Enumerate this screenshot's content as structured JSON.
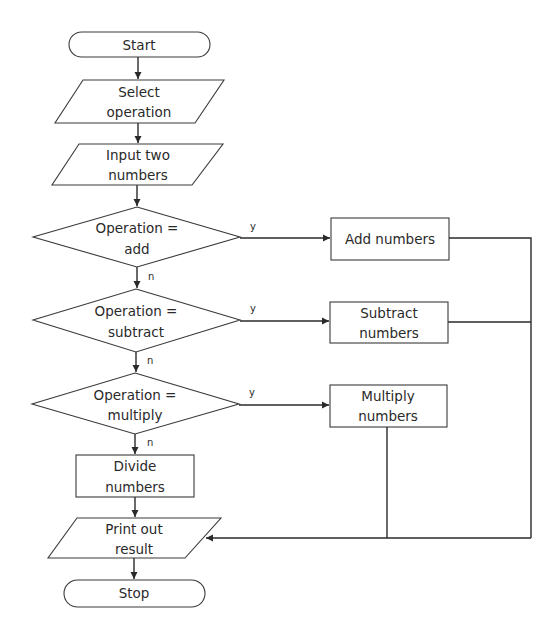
{
  "diagram": {
    "type": "flowchart",
    "nodes": {
      "start": {
        "shape": "terminator",
        "lines": [
          "Start"
        ]
      },
      "select": {
        "shape": "input-output",
        "lines": [
          "Select",
          "operation"
        ]
      },
      "input": {
        "shape": "input-output",
        "lines": [
          "Input two",
          "numbers"
        ]
      },
      "dec_add": {
        "shape": "decision",
        "lines": [
          "Operation =",
          "add"
        ]
      },
      "dec_sub": {
        "shape": "decision",
        "lines": [
          "Operation =",
          "subtract"
        ]
      },
      "dec_mul": {
        "shape": "decision",
        "lines": [
          "Operation =",
          "multiply"
        ]
      },
      "add": {
        "shape": "process",
        "lines": [
          "Add numbers"
        ]
      },
      "sub": {
        "shape": "process",
        "lines": [
          "Subtract",
          "numbers"
        ]
      },
      "mul": {
        "shape": "process",
        "lines": [
          "Multiply",
          "numbers"
        ]
      },
      "div": {
        "shape": "process",
        "lines": [
          "Divide",
          "numbers"
        ]
      },
      "print": {
        "shape": "input-output",
        "lines": [
          "Print out",
          "result"
        ]
      },
      "stop": {
        "shape": "terminator",
        "lines": [
          "Stop"
        ]
      }
    },
    "edge_labels": {
      "yes": "y",
      "no": "n"
    },
    "edges": [
      {
        "from": "start",
        "to": "select"
      },
      {
        "from": "select",
        "to": "input"
      },
      {
        "from": "input",
        "to": "dec_add"
      },
      {
        "from": "dec_add",
        "to": "add",
        "label": "y"
      },
      {
        "from": "dec_add",
        "to": "dec_sub",
        "label": "n"
      },
      {
        "from": "dec_sub",
        "to": "sub",
        "label": "y"
      },
      {
        "from": "dec_sub",
        "to": "dec_mul",
        "label": "n"
      },
      {
        "from": "dec_mul",
        "to": "mul",
        "label": "y"
      },
      {
        "from": "dec_mul",
        "to": "div",
        "label": "n"
      },
      {
        "from": "div",
        "to": "print"
      },
      {
        "from": "add",
        "to": "print"
      },
      {
        "from": "sub",
        "to": "print"
      },
      {
        "from": "mul",
        "to": "print"
      },
      {
        "from": "print",
        "to": "stop"
      }
    ],
    "colors": {
      "stroke": "#3a3a3a",
      "text": "#2a2a2a",
      "background": "#ffffff"
    }
  }
}
